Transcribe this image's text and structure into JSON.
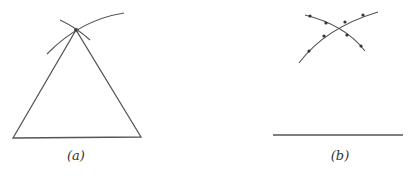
{
  "figure": {
    "panels": [
      {
        "id": "a",
        "label": "(a)",
        "description": "Equilateral triangle constructed from intersecting arcs at apex"
      },
      {
        "id": "b",
        "label": "(b)",
        "description": "Base segment with two intersecting dotted arcs above"
      }
    ],
    "colors": {
      "stroke": "#555555",
      "background": "#ffffff"
    }
  }
}
